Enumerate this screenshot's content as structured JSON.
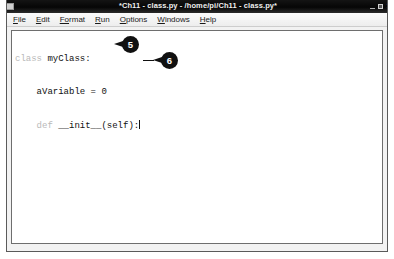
{
  "window": {
    "title": "*Ch11 - class.py - /home/pi/Ch11 - class.py*",
    "icon": "window-icon",
    "controls": {
      "minimize": "minimize-icon",
      "maximize": "maximize-icon",
      "close": "×"
    }
  },
  "menubar": {
    "items": [
      {
        "mnemonic": "F",
        "rest": "ile"
      },
      {
        "mnemonic": "E",
        "rest": "dit"
      },
      {
        "mnemonic": "Fo",
        "rest": "rmat"
      },
      {
        "mnemonic": "R",
        "rest": "un"
      },
      {
        "mnemonic": "O",
        "rest": "ptions"
      },
      {
        "mnemonic": "W",
        "rest": "indows"
      },
      {
        "mnemonic": "H",
        "rest": "elp"
      }
    ]
  },
  "editor": {
    "lines": [
      {
        "keyword": "class",
        "text": " myClass:"
      },
      {
        "keyword": "",
        "text": "    aVariable = 0"
      },
      {
        "keyword": "    def",
        "text": " __init__(self):"
      }
    ]
  },
  "callouts": [
    {
      "number": "5"
    },
    {
      "number": "6"
    }
  ]
}
